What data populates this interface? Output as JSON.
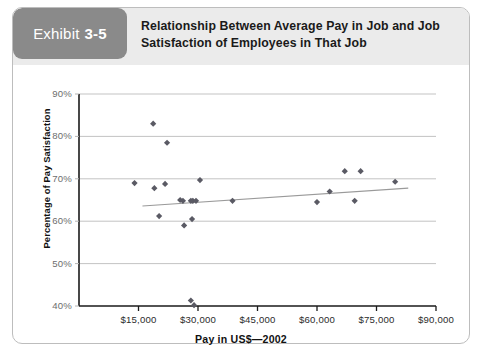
{
  "exhibit": {
    "tag_word": "Exhibit",
    "tag_number": "3-5",
    "title_line_1": "Relationship Between Average Pay in Job and Job",
    "title_line_2": "Satisfaction of Employees in That Job"
  },
  "colors": {
    "tag_background": "#8a8a8a",
    "header_background": "#ebebeb",
    "card_border": "#bdbdbd",
    "marker": "#5a5a64",
    "gridline": "#b4b4b4",
    "axis": "#1a1a1a",
    "trendline": "#9a9a9a"
  },
  "chart_data": {
    "type": "scatter",
    "title": "Relationship Between Average Pay in Job and Job Satisfaction of Employees in That Job",
    "xlabel": "Pay in US$—2002",
    "ylabel": "Percentage of Pay Satisfaction",
    "xlim": [
      0,
      90000
    ],
    "ylim": [
      40,
      90
    ],
    "xticks": [
      15000,
      30000,
      45000,
      60000,
      75000,
      90000
    ],
    "xtick_labels": [
      "$15,000",
      "$30,000",
      "$45,000",
      "$60,000",
      "$75,000",
      "$90,000"
    ],
    "yticks": [
      40,
      50,
      60,
      70,
      80,
      90
    ],
    "ytick_labels": [
      "40%",
      "50%",
      "60%",
      "70%",
      "80%",
      "90%"
    ],
    "grid": "horizontal",
    "legend": "none",
    "series": [
      {
        "name": "Jobs",
        "marker": "diamond",
        "points": [
          {
            "x": 18700,
            "y": 83.0
          },
          {
            "x": 22200,
            "y": 78.5
          },
          {
            "x": 14000,
            "y": 69.0
          },
          {
            "x": 21700,
            "y": 68.8
          },
          {
            "x": 19000,
            "y": 67.8
          },
          {
            "x": 20200,
            "y": 61.2
          },
          {
            "x": 25500,
            "y": 65.0
          },
          {
            "x": 26200,
            "y": 64.8
          },
          {
            "x": 26500,
            "y": 59.0
          },
          {
            "x": 28200,
            "y": 64.8
          },
          {
            "x": 28500,
            "y": 60.5
          },
          {
            "x": 28700,
            "y": 64.8
          },
          {
            "x": 29500,
            "y": 64.8
          },
          {
            "x": 30500,
            "y": 69.7
          },
          {
            "x": 38700,
            "y": 64.8
          },
          {
            "x": 28200,
            "y": 41.3
          },
          {
            "x": 29000,
            "y": 40.2
          },
          {
            "x": 60000,
            "y": 64.5
          },
          {
            "x": 63200,
            "y": 67.0
          },
          {
            "x": 67000,
            "y": 71.8
          },
          {
            "x": 69500,
            "y": 64.8
          },
          {
            "x": 71000,
            "y": 71.8
          },
          {
            "x": 79700,
            "y": 69.3
          }
        ]
      }
    ],
    "trendline": {
      "name": "Linear fit",
      "x_start": 16000,
      "y_start": 63.6,
      "x_end": 83000,
      "y_end": 67.8
    }
  }
}
